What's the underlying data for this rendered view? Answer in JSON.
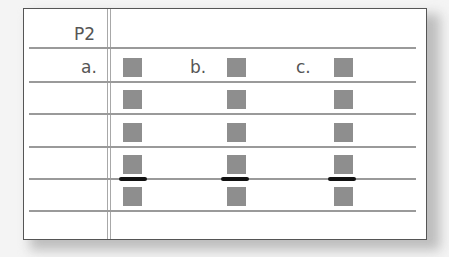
{
  "header": {
    "title": "P2"
  },
  "columns": [
    {
      "label": "a.",
      "squares": 5,
      "marker_after_row": 4
    },
    {
      "label": "b.",
      "squares": 5,
      "marker_after_row": 4
    },
    {
      "label": "c.",
      "squares": 5,
      "marker_after_row": 4
    }
  ],
  "colors": {
    "square": "#8e8e8e",
    "marker": "#111111",
    "line": "#9a9a9a",
    "text": "#555555"
  }
}
